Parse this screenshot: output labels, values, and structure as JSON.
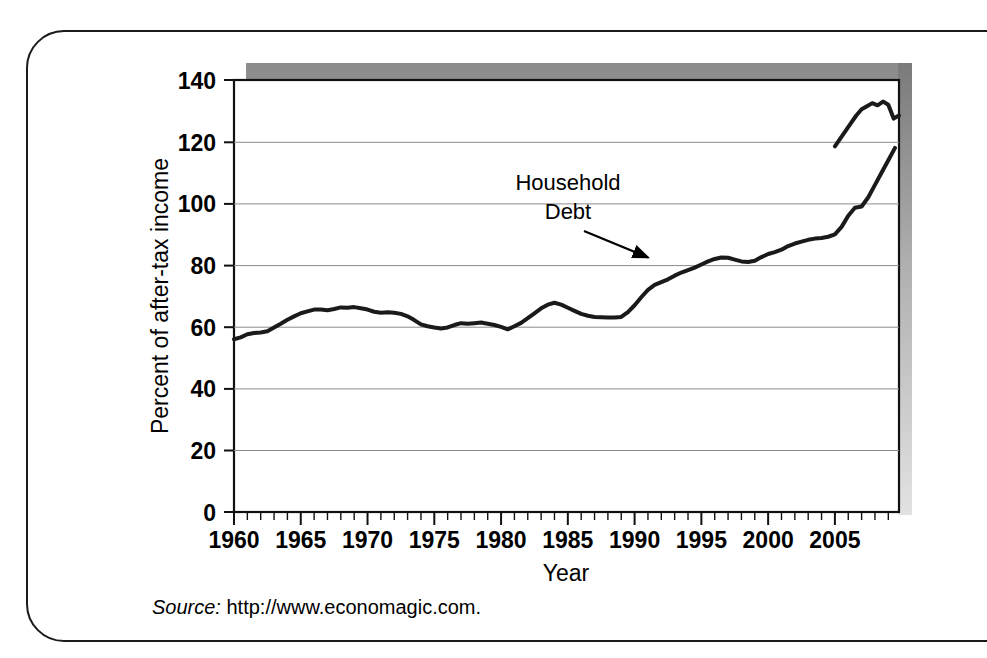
{
  "figure": {
    "source_label": "Source:",
    "source_url": "http://www.economagic.com."
  },
  "chart_data": {
    "type": "line",
    "title": "",
    "xlabel": "Year",
    "ylabel": "Percent of after-tax income",
    "xlim": [
      1960,
      2009.8
    ],
    "ylim": [
      0,
      140
    ],
    "ytick_labels": [
      "0",
      "20",
      "40",
      "60",
      "80",
      "100",
      "120",
      "140"
    ],
    "yticks": [
      0,
      20,
      40,
      60,
      80,
      100,
      120,
      140
    ],
    "xtick_labels": [
      "1960",
      "1965",
      "1970",
      "1975",
      "1980",
      "1985",
      "1990",
      "1995",
      "2000",
      "2005"
    ],
    "xticks": [
      1960,
      1965,
      1970,
      1975,
      1980,
      1985,
      1990,
      1995,
      2000,
      2005
    ],
    "minor_xtick_interval": 1,
    "grid": "horizontal",
    "legend": "none",
    "annotations": [
      {
        "text_line1": "Household",
        "text_line2": "Debt",
        "point_year": 1991.0,
        "point_value": 82.5
      }
    ],
    "series": [
      {
        "name": "Household Debt",
        "color": "#1a1a1a",
        "x": [
          1960,
          1960.5,
          1961,
          1961.5,
          1962,
          1962.5,
          1963,
          1963.5,
          1964,
          1964.5,
          1965,
          1965.5,
          1966,
          1966.5,
          1967,
          1967.5,
          1968,
          1968.5,
          1969,
          1969.5,
          1970,
          1970.5,
          1971,
          1971.5,
          1972,
          1972.5,
          1973,
          1973.5,
          1974,
          1974.5,
          1975,
          1975.5,
          1976,
          1976.5,
          1977,
          1977.5,
          1978,
          1978.5,
          1979,
          1979.5,
          1980,
          1980.5,
          1981,
          1981.5,
          1982,
          1982.5,
          1983,
          1983.5,
          1984,
          1984.5,
          1985,
          1985.5,
          1986,
          1986.5,
          1987,
          1987.5,
          1988,
          1988.5,
          1989,
          1989.5,
          1990,
          1990.5,
          1991,
          1991.5,
          1992,
          1992.5,
          1993,
          1993.5,
          1994,
          1994.5,
          1995,
          1995.5,
          1996,
          1996.5,
          1997,
          1997.5,
          1998,
          1998.5,
          1999,
          1999.5,
          2000,
          2000.5,
          2001,
          2001.5,
          2002,
          2002.5,
          2003,
          2003.5,
          2004,
          2004.5,
          2005,
          2005.5,
          2006,
          2006.5,
          2007,
          2007.5,
          2008,
          2008.5,
          2009,
          2009.5
        ],
        "y": [
          56.0,
          56.6,
          57.6,
          58.0,
          58.2,
          58.6,
          59.8,
          61.0,
          62.3,
          63.4,
          64.4,
          65.0,
          65.6,
          65.6,
          65.4,
          65.8,
          66.3,
          66.2,
          66.4,
          66.0,
          65.6,
          64.9,
          64.6,
          64.7,
          64.6,
          64.2,
          63.4,
          62.2,
          60.8,
          60.2,
          59.8,
          59.5,
          59.8,
          60.6,
          61.2,
          61.0,
          61.2,
          61.4,
          61.0,
          60.6,
          60.0,
          59.2,
          60.2,
          61.3,
          62.8,
          64.4,
          66.0,
          67.2,
          67.8,
          67.2,
          66.2,
          65.2,
          64.2,
          63.6,
          63.2,
          63.1,
          63.0,
          63.0,
          63.2,
          64.8,
          67.0,
          69.6,
          72.0,
          73.6,
          74.5,
          75.4,
          76.6,
          77.6,
          78.4,
          79.2,
          80.2,
          81.2,
          82.0,
          82.5,
          82.4,
          81.8,
          81.2,
          81.0,
          81.4,
          82.6,
          83.6,
          84.2,
          85.0,
          86.2,
          87.0,
          87.6,
          88.2,
          88.6,
          88.8,
          89.2,
          90.0,
          92.4,
          96.0,
          98.6,
          99.0,
          102.0,
          106.0,
          110.0,
          114.0,
          118.0
        ]
      },
      {
        "name": "Household Debt (continued)",
        "color": "#1a1a1a",
        "x": [
          2005.0,
          2005.4,
          2005.8,
          2006.2,
          2006.6,
          2007.0,
          2007.4,
          2007.8,
          2008.2,
          2008.6,
          2009.0,
          2009.4,
          2009.8
        ],
        "y": [
          118.5,
          121.0,
          123.5,
          126.0,
          128.5,
          130.5,
          131.5,
          132.5,
          131.8,
          133.0,
          132.0,
          127.5,
          128.5
        ]
      }
    ]
  }
}
